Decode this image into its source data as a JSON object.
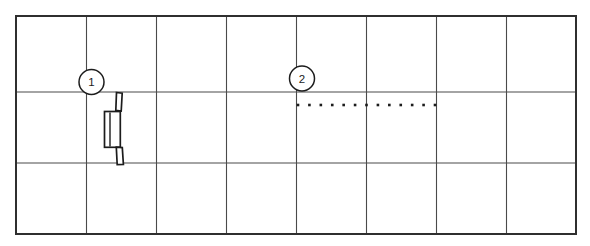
{
  "figure": {
    "width": 590,
    "height": 246,
    "background": "#ffffff",
    "colors": {
      "border": "#2f2f2f",
      "grid": "#4a4a4a",
      "ink": "#1c1c1c",
      "callout_fill": "#ffffff"
    },
    "border": {
      "x": 16,
      "y": 16,
      "w": 560,
      "h": 218
    },
    "grid": {
      "cols": 8,
      "rows": 3,
      "vertical_x": [
        86.5,
        156.5,
        226.5,
        296.5,
        366.5,
        436.5,
        506.5
      ],
      "horizontal_y": [
        92,
        163
      ]
    },
    "callouts": [
      {
        "label": "1",
        "cx": 91.5,
        "cy": 82,
        "r": 12.5
      },
      {
        "label": "2",
        "cx": 302,
        "cy": 78.5,
        "r": 12.5
      }
    ],
    "dotted_line": {
      "y": 105,
      "x_start": 298,
      "x_end": 435,
      "dot_count": 13,
      "dot_size": 2.6
    },
    "part_sketch": {
      "top_tab_points": "116.5,92.5 122.2,93.2 121.2,111 115.8,110.4",
      "mid_box": {
        "x": 104.5,
        "y": 111.5,
        "w": 15.8,
        "h": 35.8
      },
      "mid_inner_line": {
        "x": 110,
        "y1": 112.5,
        "y2": 146.5
      },
      "bottom_tab_points": "116.3,147.2 122.3,147.6 123.4,164.4 117.2,164.7"
    }
  }
}
